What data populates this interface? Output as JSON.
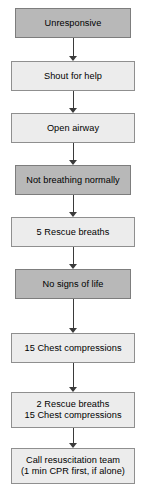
{
  "diagram": {
    "orientation": "vertical-top-down",
    "background_color": "#ffffff",
    "palette": {
      "dark_fill": "#b8b8b8",
      "light_fill": "#ececec",
      "border": "#8a8a8a",
      "text": "#000000",
      "connector": "#3a3a3a"
    },
    "nodes": [
      {
        "id": "unresponsive",
        "label": "Unresponsive",
        "shade": "dark",
        "x": 15,
        "y": 8,
        "width": 116,
        "height": 30
      },
      {
        "id": "shout-for-help",
        "label": "Shout for help",
        "shade": "light",
        "x": 11,
        "y": 61,
        "width": 124,
        "height": 30
      },
      {
        "id": "open-airway",
        "label": "Open airway",
        "shade": "light",
        "x": 11,
        "y": 113,
        "width": 124,
        "height": 30
      },
      {
        "id": "not-breathing-normally",
        "label": "Not breathing normally",
        "shade": "dark",
        "x": 15,
        "y": 165,
        "width": 116,
        "height": 30
      },
      {
        "id": "five-rescue-breaths",
        "label": "5 Rescue breaths",
        "shade": "light",
        "x": 11,
        "y": 217,
        "width": 124,
        "height": 30
      },
      {
        "id": "no-signs-of-life",
        "label": "No signs of life",
        "shade": "dark",
        "x": 15,
        "y": 269,
        "width": 116,
        "height": 30
      },
      {
        "id": "fifteen-chest-compressions",
        "label": "15 Chest compressions",
        "shade": "light",
        "x": 11,
        "y": 333,
        "width": 124,
        "height": 30
      },
      {
        "id": "two-breaths-fifteen-compressions",
        "label": "2 Rescue breaths\n15 Chest compressions",
        "shade": "light",
        "x": 11,
        "y": 392,
        "width": 124,
        "height": 36
      },
      {
        "id": "call-resuscitation-team",
        "label": "Call resuscitation team\n(1 min CPR first, if alone)",
        "shade": "light",
        "x": 11,
        "y": 448,
        "width": 124,
        "height": 36
      }
    ],
    "connectors": [
      {
        "id": "arrow-1",
        "from": "unresponsive",
        "to": "shout-for-help",
        "x": 73,
        "y": 38,
        "height": 23
      },
      {
        "id": "arrow-2",
        "from": "shout-for-help",
        "to": "open-airway",
        "x": 73,
        "y": 91,
        "height": 22
      },
      {
        "id": "arrow-3",
        "from": "open-airway",
        "to": "not-breathing-normally",
        "x": 73,
        "y": 143,
        "height": 22
      },
      {
        "id": "arrow-4",
        "from": "not-breathing-normally",
        "to": "five-rescue-breaths",
        "x": 73,
        "y": 195,
        "height": 22
      },
      {
        "id": "arrow-5",
        "from": "five-rescue-breaths",
        "to": "no-signs-of-life",
        "x": 73,
        "y": 247,
        "height": 22
      },
      {
        "id": "arrow-6",
        "from": "no-signs-of-life",
        "to": "fifteen-chest-compressions",
        "x": 73,
        "y": 299,
        "height": 34
      },
      {
        "id": "arrow-7",
        "from": "fifteen-chest-compressions",
        "to": "two-breaths-fifteen-compressions",
        "x": 73,
        "y": 363,
        "height": 29
      },
      {
        "id": "arrow-8",
        "from": "two-breaths-fifteen-compressions",
        "to": "call-resuscitation-team",
        "x": 73,
        "y": 428,
        "height": 20
      }
    ]
  }
}
